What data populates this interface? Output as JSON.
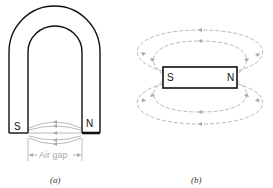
{
  "figure_a": {
    "caption": "(a)",
    "type": "horseshoe-magnet",
    "pole_left": "S",
    "pole_right": "N",
    "gap_label": "Air gap"
  },
  "figure_b": {
    "caption": "(b)",
    "type": "bar-magnet",
    "pole_left": "S",
    "pole_right": "N"
  },
  "colors": {
    "outline": "#111111",
    "field_lines": "#a8a8a8",
    "background": "#ffffff"
  }
}
